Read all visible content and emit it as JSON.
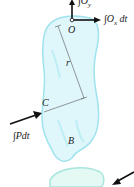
{
  "diagram": {
    "labels": {
      "o_point": "O",
      "c_point": "C",
      "b_label": "B",
      "r_label": "r",
      "ox_impulse": "∫O",
      "ox_sub": "x",
      "ox_dt": " dt",
      "oy_impulse": "∫O",
      "oy_sub": "y",
      "p_impulse": "∫Pdt"
    },
    "colors": {
      "body_fill": "#dff6fb",
      "body_stroke": "#9fe3ef",
      "arrow": "#111111",
      "dim_line": "#555555"
    }
  }
}
